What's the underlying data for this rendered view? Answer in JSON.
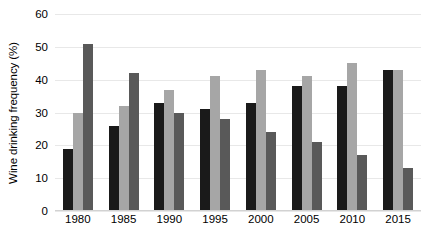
{
  "chart_data": {
    "type": "bar",
    "title": "",
    "subtitle": "",
    "xlabel": "",
    "ylabel": "Wine drinking frequency (%)",
    "categories": [
      "1980",
      "1985",
      "1990",
      "1995",
      "2000",
      "2005",
      "2010",
      "2015"
    ],
    "series": [
      {
        "name": "series-1",
        "color": "#1a1a1a",
        "values": [
          19,
          26,
          33,
          31,
          33,
          38,
          38,
          43
        ]
      },
      {
        "name": "series-2",
        "color": "#a6a6a6",
        "values": [
          30,
          32,
          37,
          41,
          43,
          41,
          45,
          43
        ]
      },
      {
        "name": "series-3",
        "color": "#595959",
        "values": [
          51,
          42,
          30,
          28,
          24,
          21,
          17,
          13
        ]
      }
    ],
    "ylim": [
      0,
      60
    ],
    "yticks": [
      0,
      10,
      20,
      30,
      40,
      50,
      60
    ],
    "ytick_labels": [
      "0",
      "10",
      "20",
      "30",
      "40",
      "50",
      "60"
    ],
    "grid": true,
    "grid_color": "#e8e8e8",
    "legend": "none",
    "background": "#ffffff",
    "axis_color": "#d2d2d2"
  }
}
